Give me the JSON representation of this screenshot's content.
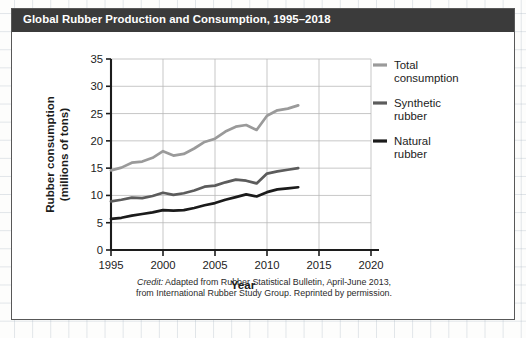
{
  "figure": {
    "title": "Global Rubber Production and Consumption, 1995–2018",
    "title_bar_color": "#3b3b3b",
    "border_color": "#585858",
    "credit_lead": "Credit:",
    "credit_line1": " Adapted from Rubber Statistical Bulletin, April-June 2013,",
    "credit_line2": "from International Rubber Study Group. Reprinted by permission."
  },
  "chart_data": {
    "type": "line",
    "title": "Global Rubber Production and Consumption, 1995–2018",
    "xlabel": "Year",
    "ylabel": "Rubber consumption (millions of tons)",
    "ylabel_line1": "Rubber consumption",
    "ylabel_line2": "(millions of tons)",
    "xlim": [
      1995,
      2020
    ],
    "ylim": [
      0,
      35
    ],
    "xticks": [
      1995,
      2000,
      2005,
      2010,
      2015,
      2020
    ],
    "yticks": [
      0,
      5,
      10,
      15,
      20,
      25,
      30,
      35
    ],
    "xtick_labels": [
      "1995",
      "2000",
      "2005",
      "2010",
      "2015",
      "2020"
    ],
    "ytick_labels": [
      "0",
      "5",
      "10",
      "15",
      "20",
      "25",
      "30",
      "35"
    ],
    "grid": "both-light",
    "legend_position": "right",
    "x": [
      1995,
      1996,
      1997,
      1998,
      1999,
      2000,
      2001,
      2002,
      2003,
      2004,
      2005,
      2006,
      2007,
      2008,
      2009,
      2010,
      2011,
      2012,
      2013
    ],
    "series": [
      {
        "name": "Total consumption",
        "label_line1": "Total",
        "label_line2": "consumption",
        "color": "#9a9a9a",
        "values": [
          14.6,
          15.1,
          16.0,
          16.2,
          16.9,
          18.1,
          17.3,
          17.6,
          18.6,
          19.8,
          20.4,
          21.7,
          22.6,
          22.9,
          22.0,
          24.6,
          25.6,
          25.9,
          26.5
        ]
      },
      {
        "name": "Synthetic rubber",
        "label_line1": "Synthetic",
        "label_line2": "rubber",
        "color": "#5c5c5c",
        "values": [
          8.9,
          9.2,
          9.6,
          9.5,
          9.9,
          10.5,
          10.1,
          10.4,
          10.9,
          11.6,
          11.8,
          12.4,
          12.9,
          12.7,
          12.2,
          14.0,
          14.4,
          14.7,
          15.0
        ]
      },
      {
        "name": "Natural rubber",
        "label_line1": "Natural",
        "label_line2": "rubber",
        "color": "#1b1b1b",
        "values": [
          5.7,
          5.9,
          6.3,
          6.6,
          6.9,
          7.3,
          7.2,
          7.3,
          7.7,
          8.2,
          8.6,
          9.2,
          9.7,
          10.2,
          9.8,
          10.6,
          11.1,
          11.3,
          11.5
        ]
      }
    ]
  }
}
